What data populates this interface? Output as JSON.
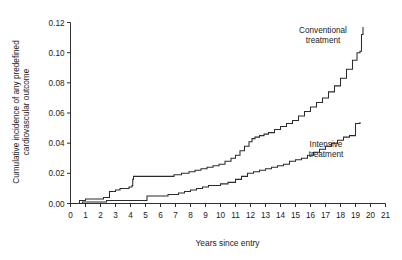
{
  "chart_data": {
    "type": "line",
    "title": "",
    "xlabel": "Years since entry",
    "ylabel": "Cumulative incidence of any predefined\ncardiovascular outcome",
    "ylabel_lines": [
      "Cumulative incidence of any predefined",
      "cardiovascular outcome"
    ],
    "xlim": [
      0,
      21
    ],
    "ylim": [
      0.0,
      0.12
    ],
    "xticks": [
      0,
      1,
      2,
      3,
      4,
      5,
      6,
      7,
      8,
      9,
      10,
      11,
      12,
      13,
      14,
      15,
      16,
      17,
      18,
      19,
      20,
      21
    ],
    "xtick_labels": [
      "0",
      "1",
      "2",
      "3",
      "4",
      "5",
      "6",
      "7",
      "8",
      "9",
      "10",
      "11",
      "12",
      "13",
      "14",
      "15",
      "16",
      "17",
      "18",
      "19",
      "20",
      "21"
    ],
    "yticks": [
      0.0,
      0.02,
      0.04,
      0.06,
      0.08,
      0.1,
      0.12
    ],
    "ytick_labels": [
      "0.00",
      "0.02",
      "0.04",
      "0.06",
      "0.08",
      "0.10",
      "0.12"
    ],
    "grid": false,
    "legend_position": "inline-annotations",
    "step_style": "post",
    "series": [
      {
        "name": "Conventional treatment",
        "color": "#2b2b2b",
        "annotation": "Conventional\ntreatment",
        "annotation_lines": [
          "Conventional",
          "treatment"
        ],
        "final_value": 0.117,
        "x": [
          0.0,
          0.6,
          1.0,
          1.6,
          2.2,
          2.6,
          3.0,
          3.3,
          3.6,
          3.9,
          4.1,
          4.15,
          4.2,
          5.4,
          6.4,
          6.9,
          7.4,
          7.9,
          8.3,
          8.7,
          9.1,
          9.5,
          9.9,
          10.3,
          10.7,
          11.0,
          11.3,
          11.6,
          11.9,
          12.1,
          12.3,
          12.6,
          12.9,
          13.2,
          13.6,
          14.0,
          14.4,
          14.8,
          15.2,
          15.6,
          16.0,
          16.4,
          16.8,
          17.2,
          17.6,
          18.0,
          18.4,
          18.8,
          19.1,
          19.3,
          19.4,
          19.5
        ],
        "y": [
          0.0,
          0.002,
          0.003,
          0.003,
          0.004,
          0.008,
          0.009,
          0.01,
          0.01,
          0.011,
          0.012,
          0.016,
          0.018,
          0.018,
          0.018,
          0.019,
          0.02,
          0.021,
          0.022,
          0.023,
          0.024,
          0.025,
          0.026,
          0.028,
          0.03,
          0.032,
          0.035,
          0.038,
          0.041,
          0.043,
          0.044,
          0.045,
          0.046,
          0.047,
          0.049,
          0.051,
          0.053,
          0.055,
          0.058,
          0.061,
          0.064,
          0.067,
          0.07,
          0.074,
          0.078,
          0.083,
          0.089,
          0.095,
          0.1,
          0.101,
          0.112,
          0.117
        ]
      },
      {
        "name": "Intensive treatment",
        "color": "#2b2b2b",
        "annotation": "Intensive\ntreatment",
        "annotation_lines": [
          "Intensive",
          "treatment"
        ],
        "final_value": 0.054,
        "x": [
          0.0,
          0.8,
          1.4,
          2.1,
          2.4,
          2.8,
          3.2,
          3.7,
          4.2,
          4.6,
          5.0,
          5.1,
          6.3,
          6.5,
          6.8,
          7.2,
          7.6,
          8.0,
          8.4,
          8.8,
          9.2,
          9.6,
          10.0,
          10.5,
          11.0,
          11.4,
          11.8,
          12.2,
          12.6,
          13.0,
          13.4,
          13.8,
          14.2,
          14.6,
          15.0,
          15.4,
          15.8,
          16.2,
          16.6,
          17.0,
          17.4,
          17.8,
          18.2,
          18.6,
          18.9,
          19.0,
          19.3
        ],
        "y": [
          0.0,
          0.001,
          0.001,
          0.001,
          0.002,
          0.002,
          0.002,
          0.002,
          0.002,
          0.002,
          0.002,
          0.005,
          0.005,
          0.006,
          0.006,
          0.007,
          0.008,
          0.009,
          0.01,
          0.011,
          0.012,
          0.012,
          0.013,
          0.014,
          0.016,
          0.018,
          0.02,
          0.021,
          0.022,
          0.023,
          0.024,
          0.025,
          0.026,
          0.028,
          0.029,
          0.03,
          0.032,
          0.034,
          0.036,
          0.038,
          0.04,
          0.042,
          0.044,
          0.045,
          0.045,
          0.053,
          0.054
        ]
      }
    ]
  }
}
